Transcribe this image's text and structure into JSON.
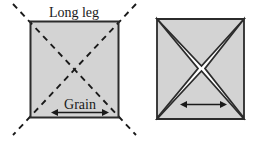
{
  "figure": {
    "title": "",
    "background_color": "#ffffff",
    "panels": [
      {
        "name": "uncut-square",
        "labels": {
          "long_leg": "Long leg",
          "grain": "Grain"
        },
        "shape": {
          "kind": "square",
          "fill_color": "#d3d3d3",
          "stroke_color": "#2b2b2b",
          "x": 30,
          "y": 21,
          "width": 89,
          "height": 97
        },
        "diagonals": {
          "style": "dashed",
          "color": "#1a1a1a",
          "extends_beyond_corners": true,
          "overshoot_px": 17
        },
        "arrow": {
          "name": "grain-direction-arrow",
          "type": "double-headed",
          "orientation": "horizontal",
          "x1": 52,
          "x2": 108,
          "y": 112
        }
      },
      {
        "name": "cut-square-four-triangles",
        "labels": {},
        "shape": {
          "kind": "square",
          "fill_color": "#d3d3d3",
          "stroke_color": "#2b2b2b",
          "x": 156,
          "y": 18,
          "width": 89,
          "height": 102
        },
        "cuts": {
          "style": "solid-gap",
          "gap_color": "#ffffff",
          "edge_color": "#2b2b2b",
          "pieces": 4,
          "description": "square separated into four triangles along both diagonals"
        },
        "arrow": {
          "name": "grain-direction-arrow",
          "type": "double-headed",
          "orientation": "horizontal",
          "x1": 181,
          "x2": 226,
          "y": 104
        }
      }
    ]
  }
}
